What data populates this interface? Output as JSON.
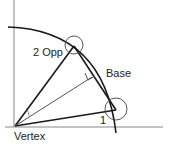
{
  "diagram": {
    "labels": {
      "opposite": "2 Opp",
      "base": "Base",
      "one": "1",
      "vertex": "Vertex"
    },
    "colors": {
      "stroke": "#1a1a1a",
      "thin": "#555555",
      "background": "#ffffff"
    }
  }
}
